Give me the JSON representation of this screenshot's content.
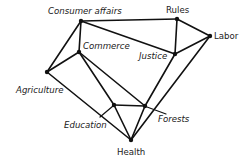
{
  "diagram": {
    "type": "network",
    "nodes": [
      {
        "id": "consumer_affairs",
        "label": "Consumer affairs",
        "x": 81,
        "y": 21,
        "label_x": 48,
        "label_y": 14,
        "italic": true
      },
      {
        "id": "rules",
        "label": "Rules",
        "x": 177,
        "y": 19,
        "label_x": 166,
        "label_y": 13,
        "italic": false
      },
      {
        "id": "labor",
        "label": "Labor",
        "x": 210,
        "y": 36,
        "label_x": 214,
        "label_y": 39,
        "italic": false
      },
      {
        "id": "commerce",
        "label": "Commerce",
        "x": 79,
        "y": 52,
        "label_x": 83,
        "label_y": 49,
        "italic": true
      },
      {
        "id": "justice",
        "label": "Justice",
        "x": 175,
        "y": 54,
        "label_x": 139,
        "label_y": 59,
        "italic": true
      },
      {
        "id": "agriculture",
        "label": "Agriculture",
        "x": 47,
        "y": 72,
        "label_x": 16,
        "label_y": 93,
        "italic": true
      },
      {
        "id": "education",
        "label": "Education",
        "x": 114,
        "y": 105,
        "label_x": 64,
        "label_y": 128,
        "italic": true
      },
      {
        "id": "forests",
        "label": "Forests",
        "x": 145,
        "y": 106,
        "label_x": 158,
        "label_y": 122,
        "italic": true
      },
      {
        "id": "health",
        "label": "Health",
        "x": 131,
        "y": 140,
        "label_x": 117,
        "label_y": 155,
        "italic": false
      }
    ],
    "edges": [
      [
        "consumer_affairs",
        "rules"
      ],
      [
        "consumer_affairs",
        "justice"
      ],
      [
        "consumer_affairs",
        "commerce"
      ],
      [
        "consumer_affairs",
        "agriculture"
      ],
      [
        "rules",
        "justice"
      ],
      [
        "rules",
        "labor"
      ],
      [
        "justice",
        "labor"
      ],
      [
        "commerce",
        "agriculture"
      ],
      [
        "commerce",
        "education"
      ],
      [
        "commerce",
        "forests"
      ],
      [
        "agriculture",
        "health"
      ],
      [
        "education",
        "forests"
      ],
      [
        "education",
        "health"
      ],
      [
        "forests",
        "health"
      ],
      [
        "justice",
        "forests"
      ],
      [
        "labor",
        "health"
      ]
    ],
    "label_pointers": [
      {
        "node": "education",
        "x1": 100,
        "y1": 117,
        "x2": 113,
        "y2": 106
      },
      {
        "node": "forests",
        "x1": 147,
        "y1": 107,
        "x2": 166,
        "y2": 114
      }
    ]
  }
}
